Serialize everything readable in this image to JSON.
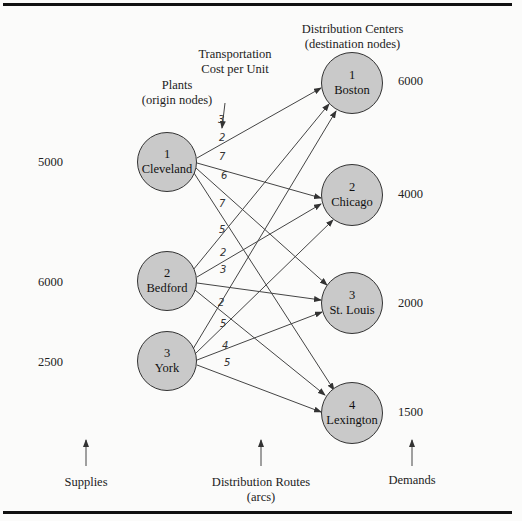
{
  "labels": {
    "plants": "Plants",
    "plants_sub": "(origin nodes)",
    "transport": "Transportation",
    "transport_sub": "Cost per Unit",
    "dc": "Distribution Centers",
    "dc_sub": "(destination nodes)",
    "supplies": "Supplies",
    "routes": "Distribution Routes",
    "routes_sub": "(arcs)",
    "demands": "Demands"
  },
  "origins": [
    {
      "id": "1",
      "name": "Cleveland",
      "supply": "5000"
    },
    {
      "id": "2",
      "name": "Bedford",
      "supply": "6000"
    },
    {
      "id": "3",
      "name": "York",
      "supply": "2500"
    }
  ],
  "destinations": [
    {
      "id": "1",
      "name": "Boston",
      "demand": "6000"
    },
    {
      "id": "2",
      "name": "Chicago",
      "demand": "4000"
    },
    {
      "id": "3",
      "name": "St. Louis",
      "demand": "2000"
    },
    {
      "id": "4",
      "name": "Lexington",
      "demand": "1500"
    }
  ],
  "costs": {
    "Cleveland": [
      "3",
      "2",
      "7",
      "6"
    ],
    "Bedford": [
      "7",
      "5",
      "2",
      "3"
    ],
    "York": [
      "2",
      "5",
      "4",
      "5"
    ]
  }
}
